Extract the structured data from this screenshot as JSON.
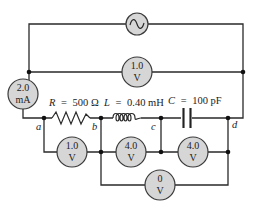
{
  "diagram": {
    "type": "AC series RLC circuit with meters",
    "source": {
      "symbol": "ac-source",
      "glyph": "~"
    },
    "meters": {
      "ammeter": {
        "value": "2.0",
        "unit": "mA"
      },
      "source_voltmeter": {
        "value": "1.0",
        "unit": "V"
      },
      "resistor_voltmeter": {
        "value": "1.0",
        "unit": "V"
      },
      "inductor_voltmeter": {
        "value": "4.0",
        "unit": "V"
      },
      "capacitor_voltmeter": {
        "value": "4.0",
        "unit": "V"
      },
      "lc_voltmeter": {
        "value": "0",
        "unit": "V"
      }
    },
    "components": {
      "resistor": {
        "symbol": "R",
        "eq": "=",
        "value": "500 Ω"
      },
      "inductor": {
        "symbol": "L",
        "eq": "=",
        "value": "0.40 mH"
      },
      "capacitor": {
        "symbol": "C",
        "eq": "=",
        "value": "100 pF"
      }
    },
    "nodes": {
      "a": "a",
      "b": "b",
      "c": "c",
      "d": "d"
    },
    "colors": {
      "meter_fill": "#d6d6d6",
      "wire": "#2a2a2a"
    }
  }
}
